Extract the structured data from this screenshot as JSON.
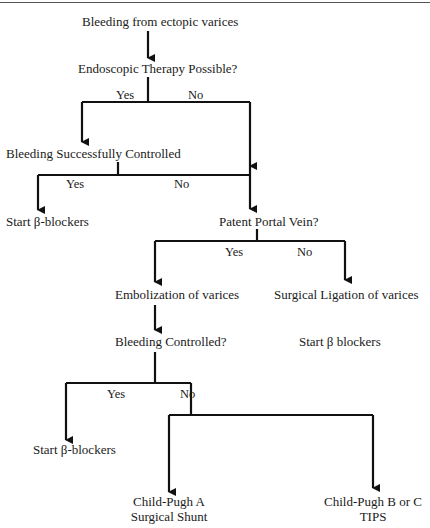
{
  "nodes": {
    "start": "Bleeding from ectopic varices",
    "endoscopic": "Endoscopic Therapy Possible?",
    "bleeding_controlled_1": "Bleeding Successfully Controlled",
    "beta_blockers_1": "Start β-blockers",
    "patent_portal": "Patent Portal Vein?",
    "embolization": "Embolization of varices",
    "surgical_ligation": "Surgical Ligation of varices",
    "bleeding_controlled_2": "Bleeding Controlled?",
    "beta_blockers_2": "Start β blockers",
    "beta_blockers_3": "Start β-blockers",
    "child_pugh_a_line1": "Child-Pugh A",
    "child_pugh_a_line2": "Surgical Shunt",
    "child_pugh_bc_line1": "Child-Pugh B or C",
    "child_pugh_bc_line2": "TIPS"
  },
  "edges": {
    "yes": "Yes",
    "no": "No"
  },
  "colors": {
    "line": "#111111",
    "text": "#1a1a1a",
    "background": "#ffffff"
  }
}
